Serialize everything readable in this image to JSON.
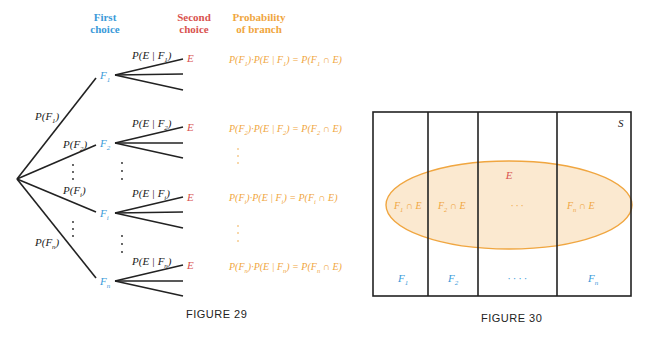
{
  "colors": {
    "first_choice": "#3a9ad9",
    "second_choice": "#d9534f",
    "probability": "#f0a640",
    "line": "#222222",
    "ellipse_fill": "#fbe9d0",
    "ellipse_stroke": "#f0a640"
  },
  "figure29": {
    "caption": "FIGURE 29",
    "headers": {
      "first_choice": [
        "First",
        "choice"
      ],
      "second_choice": [
        "Second",
        "choice"
      ],
      "probability": [
        "Probability",
        "of branch"
      ]
    },
    "first_level": [
      {
        "node": "F",
        "sub": "1",
        "edge_label": "P(F",
        "edge_sub": "1",
        "cond_label": "P(E | F",
        "cond_sub": "1",
        "outcome": "E",
        "branch_prob": {
          "a": "P(F",
          "a_sub": "1",
          "b": ")·P(E | F",
          "b_sub": "1",
          "c": ") = P(F",
          "c_sub": "1",
          "d": " ∩ E)"
        }
      },
      {
        "node": "F",
        "sub": "2",
        "edge_label": "P(F",
        "edge_sub": "2",
        "cond_label": "P(E | F",
        "cond_sub": "2",
        "outcome": "E",
        "branch_prob": {
          "a": "P(F",
          "a_sub": "2",
          "b": ")·P(E | F",
          "b_sub": "2",
          "c": ") = P(F",
          "c_sub": "2",
          "d": " ∩ E)"
        }
      },
      {
        "node": "F",
        "sub": "i",
        "edge_label": "P(F",
        "edge_sub": "i",
        "cond_label": "P(E | F",
        "cond_sub": "i",
        "outcome": "E",
        "branch_prob": {
          "a": "P(F",
          "a_sub": "i",
          "b": ")·P(E | F",
          "b_sub": "i",
          "c": ") = P(F",
          "c_sub": "i",
          "d": " ∩ E)"
        }
      },
      {
        "node": "F",
        "sub": "n",
        "edge_label": "P(F",
        "edge_sub": "n",
        "cond_label": "P(E | F",
        "cond_sub": "n",
        "outcome": "E",
        "branch_prob": {
          "a": "P(F",
          "a_sub": "n",
          "b": ")·P(E | F",
          "b_sub": "n",
          "c": ") = P(F",
          "c_sub": "n",
          "d": " ∩ E)"
        }
      }
    ]
  },
  "figure30": {
    "caption": "FIGURE 30",
    "sample_space_label": "S",
    "event_label": "E",
    "partitions": [
      {
        "label": "F",
        "sub": "1",
        "intersection": "F",
        "int_sub": "1",
        "int_rest": " ∩ E"
      },
      {
        "label": "F",
        "sub": "2",
        "intersection": "F",
        "int_sub": "2",
        "int_rest": " ∩ E"
      },
      {
        "label": "· · · ·",
        "sub": "",
        "intersection": "· · ·",
        "int_sub": "",
        "int_rest": ""
      },
      {
        "label": "F",
        "sub": "n",
        "intersection": "F",
        "int_sub": "n",
        "int_rest": " ∩ E"
      }
    ]
  }
}
